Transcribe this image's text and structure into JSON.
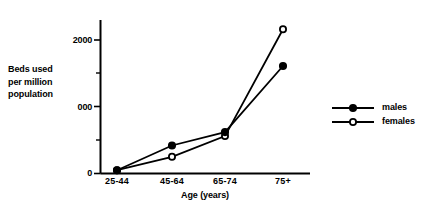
{
  "chart_data": {
    "type": "line",
    "title": "",
    "subtitle": "",
    "xlabel": "Age (years)",
    "ylabel": "Beds used\nper million\npopulation",
    "categories": [
      "25-44",
      "45-64",
      "65-74",
      "75+"
    ],
    "series": [
      {
        "name": "males",
        "marker": "filled-circle",
        "values": [
          50,
          420,
          620,
          1610
        ]
      },
      {
        "name": "females",
        "marker": "open-circle",
        "values": [
          50,
          250,
          560,
          2160
        ]
      }
    ],
    "ylim": [
      0,
      2300
    ],
    "ytick_values": [
      0,
      1000,
      2000
    ],
    "ytick_labels": [
      "0",
      "000",
      "2000"
    ],
    "yminor_tick_values": [
      500,
      1500
    ],
    "grid": false,
    "legend_position": "right",
    "legend_entries": [
      "males",
      "females"
    ],
    "axis_color": "#000000",
    "series_color": "#000000"
  },
  "axes": {
    "y_title": "Beds used\nper million\npopulation",
    "x_title": "Age (years)",
    "y_labels": {
      "t0": "0",
      "t1000": "000",
      "t2000": "2000"
    },
    "x_labels": {
      "c0": "25-44",
      "c1": "45-64",
      "c2": "65-74",
      "c3": "75+"
    }
  },
  "legend": {
    "males_label": "males",
    "females_label": "females"
  }
}
